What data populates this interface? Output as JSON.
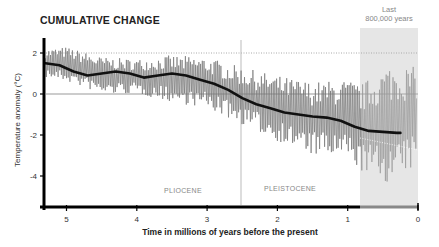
{
  "title": "CUMULATIVE CHANGE",
  "shaded_label_line1": "Last",
  "shaded_label_line2": "800,000 years",
  "xlabel": "Time in millions of years before the present",
  "ylabel": "Temperature anomaly (°C)",
  "epochs": [
    {
      "name": "PLIOCENE"
    },
    {
      "name": "PLEISTOCENE"
    }
  ],
  "colors": {
    "raw_series": "#777777",
    "raw_series_recent": "#999999",
    "smoothed": "#111111",
    "zero_line": "#bbbbbb",
    "dotted_ref": "#aaaaaa",
    "shade": "#e6e6e6",
    "axis": "#000000"
  },
  "chart_data": {
    "type": "line",
    "title": "CUMULATIVE CHANGE",
    "xlabel": "Time in millions of years before the present",
    "ylabel": "Temperature anomaly (°C)",
    "xlim": [
      5.3,
      0
    ],
    "ylim": [
      -5.5,
      2.5
    ],
    "x_ticks": [
      5,
      4,
      3,
      2,
      1,
      0
    ],
    "y_ticks": [
      2,
      0,
      -2,
      -4
    ],
    "grid": false,
    "reference_lines": [
      {
        "type": "horizontal",
        "y": 0,
        "style": "solid",
        "color": "#bbbbbb"
      },
      {
        "type": "horizontal",
        "y": 2,
        "style": "dotted",
        "color": "#aaaaaa"
      },
      {
        "type": "vertical",
        "x": 2.58,
        "label": "Pliocene/Pleistocene boundary"
      }
    ],
    "shaded_region": {
      "x_from": 0.8,
      "x_to": 0,
      "label": "Last 800,000 years"
    },
    "annotations": [
      {
        "text": "PLIOCENE",
        "x": 3.75,
        "y": -4.9
      },
      {
        "text": "PLEISTOCENE",
        "x": 1.9,
        "y": -4.9
      },
      {
        "text": "Last 800,000 years",
        "x": 0.4,
        "y": 2.9
      }
    ],
    "series": [
      {
        "name": "Smoothed temperature anomaly",
        "style": "thick black",
        "x": [
          5.3,
          5.1,
          4.9,
          4.7,
          4.5,
          4.3,
          4.1,
          3.9,
          3.7,
          3.5,
          3.3,
          3.1,
          2.9,
          2.7,
          2.5,
          2.3,
          2.1,
          1.9,
          1.7,
          1.5,
          1.3,
          1.1,
          0.9,
          0.7,
          0.5,
          0.3,
          0.25
        ],
        "values": [
          1.5,
          1.4,
          1.1,
          0.9,
          1.0,
          1.1,
          1.0,
          0.8,
          0.9,
          1.0,
          0.9,
          0.7,
          0.5,
          0.2,
          -0.2,
          -0.5,
          -0.7,
          -0.9,
          -1.0,
          -1.1,
          -1.15,
          -1.3,
          -1.6,
          -1.8,
          -1.85,
          -1.9,
          -1.9
        ]
      },
      {
        "name": "Raw temperature anomaly (approx. envelope)",
        "style": "thin gray, high-frequency oscillation",
        "x": [
          5.3,
          5.0,
          4.5,
          4.0,
          3.5,
          3.0,
          2.5,
          2.0,
          1.5,
          1.0,
          0.8,
          0.4,
          0.0
        ],
        "upper": [
          2.2,
          2.3,
          1.8,
          1.7,
          1.9,
          1.8,
          1.3,
          0.9,
          0.6,
          0.7,
          0.5,
          1.5,
          1.3
        ],
        "lower": [
          0.8,
          0.6,
          0.0,
          0.0,
          -0.4,
          -0.7,
          -1.5,
          -2.3,
          -3.0,
          -3.2,
          -3.8,
          -4.4,
          -3.5
        ]
      }
    ]
  }
}
